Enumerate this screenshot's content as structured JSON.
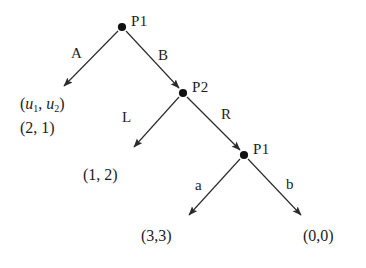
{
  "diagram": {
    "type": "game-tree",
    "background_color": "#ffffff",
    "line_color": "#2b2b2b",
    "node_color": "#111111"
  },
  "nodes": [
    {
      "id": "root",
      "label": "P1",
      "x": 122,
      "y": 27,
      "player": "P1"
    },
    {
      "id": "n2",
      "label": "P2",
      "x": 183,
      "y": 93,
      "player": "P2"
    },
    {
      "id": "n3",
      "label": "P1",
      "x": 244,
      "y": 155,
      "player": "P1"
    }
  ],
  "edges": [
    {
      "id": "e-A",
      "label": "A",
      "from": "root",
      "to": "leaf1",
      "label_x": 71,
      "label_y": 46
    },
    {
      "id": "e-B",
      "label": "B",
      "from": "root",
      "to": "n2",
      "label_x": 158,
      "label_y": 48
    },
    {
      "id": "e-L",
      "label": "L",
      "from": "n2",
      "to": "leaf2",
      "label_x": 122,
      "label_y": 110
    },
    {
      "id": "e-R",
      "label": "R",
      "from": "n2",
      "to": "n3",
      "label_x": 221,
      "label_y": 107
    },
    {
      "id": "e-a",
      "label": "a",
      "from": "n3",
      "to": "leaf3",
      "label_x": 195,
      "label_y": 178
    },
    {
      "id": "e-b",
      "label": "b",
      "from": "n3",
      "to": "leaf4",
      "label_x": 286,
      "label_y": 177
    }
  ],
  "payoffs": {
    "legend_open": "(",
    "legend_u1": "u",
    "legend_sub1": "1",
    "legend_comma": ", ",
    "legend_u2": "u",
    "legend_sub2": "2",
    "legend_close": ")",
    "leaf1": "(2, 1)",
    "leaf2": "(1, 2)",
    "leaf3": "(3,3)",
    "leaf4": "(0,0)"
  }
}
